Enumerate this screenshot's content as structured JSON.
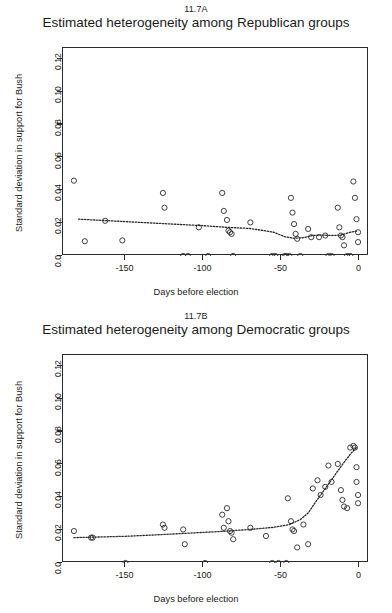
{
  "figure": {
    "background": "#ffffff",
    "foreground": "#2b2b2b",
    "point_color": "#2b2b2b",
    "line_color": "#2b2b2b"
  },
  "panels": [
    {
      "id": "11.7A",
      "title": "Estimated heterogeneity among Republican groups",
      "name": "republican"
    },
    {
      "id": "11.7B",
      "title": "Estimated heterogeneity among Democratic groups",
      "name": "democratic"
    }
  ],
  "axes": {
    "xlabel": "Days before election",
    "ylabel": "Standard deviation in support for Bush",
    "xticks": [
      -150,
      -100,
      -50,
      0
    ],
    "xticklabels": [
      "-150",
      "-100",
      "-50",
      "0"
    ],
    "yticks": [
      0.0,
      0.02,
      0.04,
      0.06,
      0.08,
      0.1,
      0.12
    ],
    "yticklabels": [
      "0.0",
      "0.02",
      "0.04",
      "0.06",
      "0.08",
      "0.10",
      "0.12"
    ],
    "xlim": [
      -190,
      6
    ],
    "ylim": [
      0.0,
      0.127
    ]
  },
  "chart_data": [
    {
      "type": "scatter",
      "panel": "11.7A",
      "title": "Estimated heterogeneity among Republican groups",
      "xlabel": "Days before election",
      "ylabel": "Standard deviation in support for Bush",
      "xlim": [
        -190,
        6
      ],
      "ylim": [
        0.0,
        0.127
      ],
      "grid": false,
      "legend": false,
      "marker": "open-circle",
      "points": [
        {
          "x": -183,
          "y": 0.046
        },
        {
          "x": -176,
          "y": 0.009
        },
        {
          "x": -163,
          "y": 0.0215
        },
        {
          "x": -152,
          "y": 0.0095
        },
        {
          "x": -126,
          "y": 0.0385
        },
        {
          "x": -125,
          "y": 0.0295
        },
        {
          "x": -113,
          "y": 0.0
        },
        {
          "x": -110,
          "y": 0.0
        },
        {
          "x": -103,
          "y": 0.0175
        },
        {
          "x": -97,
          "y": 0.0
        },
        {
          "x": -88,
          "y": 0.0385
        },
        {
          "x": -87,
          "y": 0.0275
        },
        {
          "x": -85,
          "y": 0.022
        },
        {
          "x": -84,
          "y": 0.0155
        },
        {
          "x": -83,
          "y": 0.0145
        },
        {
          "x": -82,
          "y": 0.0135
        },
        {
          "x": -81,
          "y": 0.0
        },
        {
          "x": -70,
          "y": 0.0205
        },
        {
          "x": -56,
          "y": 0.0
        },
        {
          "x": -54,
          "y": 0.0
        },
        {
          "x": -48,
          "y": 0.0
        },
        {
          "x": -47,
          "y": 0.0
        },
        {
          "x": -45,
          "y": 0.0
        },
        {
          "x": -44,
          "y": 0.0355
        },
        {
          "x": -43,
          "y": 0.0265
        },
        {
          "x": -42,
          "y": 0.0195
        },
        {
          "x": -41,
          "y": 0.0135
        },
        {
          "x": -40,
          "y": 0.0105
        },
        {
          "x": -38,
          "y": 0.0
        },
        {
          "x": -33,
          "y": 0.0165
        },
        {
          "x": -31,
          "y": 0.0115
        },
        {
          "x": -26,
          "y": 0.0115
        },
        {
          "x": -22,
          "y": 0.0125
        },
        {
          "x": -20,
          "y": 0.0
        },
        {
          "x": -18,
          "y": 0.0
        },
        {
          "x": -14,
          "y": 0.0295
        },
        {
          "x": -13,
          "y": 0.0175
        },
        {
          "x": -12,
          "y": 0.0125
        },
        {
          "x": -11,
          "y": 0.0115
        },
        {
          "x": -10,
          "y": 0.0065
        },
        {
          "x": -8,
          "y": 0.0
        },
        {
          "x": -6,
          "y": 0.0
        },
        {
          "x": -4,
          "y": 0.0455
        },
        {
          "x": -3,
          "y": 0.0355
        },
        {
          "x": -2,
          "y": 0.0225
        },
        {
          "x": -1,
          "y": 0.0145
        },
        {
          "x": -1,
          "y": 0.0085
        }
      ],
      "trend_line": {
        "style": "dotted",
        "points": [
          {
            "x": -180,
            "y": 0.0225
          },
          {
            "x": -160,
            "y": 0.0215
          },
          {
            "x": -140,
            "y": 0.0205
          },
          {
            "x": -120,
            "y": 0.0195
          },
          {
            "x": -100,
            "y": 0.0185
          },
          {
            "x": -85,
            "y": 0.0175
          },
          {
            "x": -70,
            "y": 0.0168
          },
          {
            "x": -55,
            "y": 0.0145
          },
          {
            "x": -48,
            "y": 0.0118
          },
          {
            "x": -42,
            "y": 0.0108
          },
          {
            "x": -36,
            "y": 0.0112
          },
          {
            "x": -30,
            "y": 0.0125
          },
          {
            "x": -24,
            "y": 0.0128
          },
          {
            "x": -18,
            "y": 0.0125
          },
          {
            "x": -12,
            "y": 0.0128
          },
          {
            "x": -6,
            "y": 0.0145
          },
          {
            "x": -2,
            "y": 0.0152
          }
        ]
      }
    },
    {
      "type": "scatter",
      "panel": "11.7B",
      "title": "Estimated heterogeneity among Democratic groups",
      "xlabel": "Days before election",
      "ylabel": "Standard deviation in support for Bush",
      "xlim": [
        -190,
        6
      ],
      "ylim": [
        0.0,
        0.127
      ],
      "grid": false,
      "legend": false,
      "marker": "open-circle",
      "points": [
        {
          "x": -183,
          "y": 0.0195
        },
        {
          "x": -172,
          "y": 0.0155
        },
        {
          "x": -171,
          "y": 0.0155
        },
        {
          "x": -150,
          "y": 0.0
        },
        {
          "x": -126,
          "y": 0.0235
        },
        {
          "x": -125,
          "y": 0.0215
        },
        {
          "x": -113,
          "y": 0.0205
        },
        {
          "x": -112,
          "y": 0.0115
        },
        {
          "x": -99,
          "y": 0.0
        },
        {
          "x": -88,
          "y": 0.0295
        },
        {
          "x": -87,
          "y": 0.0215
        },
        {
          "x": -85,
          "y": 0.0335
        },
        {
          "x": -84,
          "y": 0.0255
        },
        {
          "x": -83,
          "y": 0.0195
        },
        {
          "x": -82,
          "y": 0.0185
        },
        {
          "x": -81,
          "y": 0.0145
        },
        {
          "x": -70,
          "y": 0.0215
        },
        {
          "x": -60,
          "y": 0.0165
        },
        {
          "x": -56,
          "y": 0.0
        },
        {
          "x": -52,
          "y": 0.0
        },
        {
          "x": -47,
          "y": 0.0
        },
        {
          "x": -46,
          "y": 0.0395
        },
        {
          "x": -44,
          "y": 0.0255
        },
        {
          "x": -43,
          "y": 0.0205
        },
        {
          "x": -42,
          "y": 0.0195
        },
        {
          "x": -40,
          "y": 0.0095
        },
        {
          "x": -36,
          "y": 0.0235
        },
        {
          "x": -33,
          "y": 0.0115
        },
        {
          "x": -30,
          "y": 0.0455
        },
        {
          "x": -27,
          "y": 0.0505
        },
        {
          "x": -25,
          "y": 0.0415
        },
        {
          "x": -22,
          "y": 0.0465
        },
        {
          "x": -20,
          "y": 0.0595
        },
        {
          "x": -18,
          "y": 0.0495
        },
        {
          "x": -14,
          "y": 0.0605
        },
        {
          "x": -12,
          "y": 0.0445
        },
        {
          "x": -11,
          "y": 0.0385
        },
        {
          "x": -10,
          "y": 0.0345
        },
        {
          "x": -8,
          "y": 0.0335
        },
        {
          "x": -6,
          "y": 0.0705
        },
        {
          "x": -4,
          "y": 0.0715
        },
        {
          "x": -3,
          "y": 0.0705
        },
        {
          "x": -2,
          "y": 0.0585
        },
        {
          "x": -2,
          "y": 0.0495
        },
        {
          "x": -1,
          "y": 0.0415
        },
        {
          "x": -1,
          "y": 0.0365
        }
      ],
      "trend_line": {
        "style": "dotted",
        "points": [
          {
            "x": -183,
            "y": 0.0155
          },
          {
            "x": -170,
            "y": 0.0158
          },
          {
            "x": -150,
            "y": 0.0163
          },
          {
            "x": -130,
            "y": 0.0172
          },
          {
            "x": -110,
            "y": 0.0182
          },
          {
            "x": -90,
            "y": 0.0192
          },
          {
            "x": -70,
            "y": 0.0205
          },
          {
            "x": -55,
            "y": 0.0218
          },
          {
            "x": -45,
            "y": 0.0235
          },
          {
            "x": -38,
            "y": 0.0265
          },
          {
            "x": -33,
            "y": 0.0305
          },
          {
            "x": -28,
            "y": 0.0375
          },
          {
            "x": -22,
            "y": 0.0455
          },
          {
            "x": -16,
            "y": 0.0535
          },
          {
            "x": -10,
            "y": 0.0615
          },
          {
            "x": -5,
            "y": 0.0675
          },
          {
            "x": -2,
            "y": 0.0705
          }
        ]
      }
    }
  ]
}
